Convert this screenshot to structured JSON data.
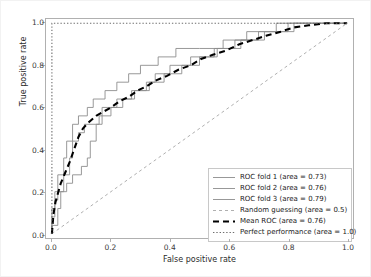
{
  "chart_data": {
    "type": "line",
    "title": "",
    "xlabel": "False positive rate",
    "ylabel": "True positive rate",
    "xlim": [
      -0.02,
      1.02
    ],
    "ylim": [
      -0.02,
      1.02
    ],
    "xticks": [
      "0.0",
      "0.2",
      "0.4",
      "0.6",
      "0.8",
      "1.0"
    ],
    "yticks": [
      "0.0",
      "0.2",
      "0.4",
      "0.6",
      "0.8",
      "1.0"
    ],
    "xtick_values": [
      0.0,
      0.2,
      0.4,
      0.6,
      0.8,
      1.0
    ],
    "ytick_values": [
      0.0,
      0.2,
      0.4,
      0.6,
      0.8,
      1.0
    ],
    "grid": false,
    "legend_position": "lower right",
    "series": [
      {
        "name": "ROC fold 1 (area = 0.73)",
        "area": 0.73,
        "style": "solid-thin",
        "color": "#8c8c8c",
        "points": [
          [
            0.0,
            0.0
          ],
          [
            0.0,
            0.04
          ],
          [
            0.02,
            0.04
          ],
          [
            0.02,
            0.12
          ],
          [
            0.03,
            0.12
          ],
          [
            0.03,
            0.2
          ],
          [
            0.05,
            0.2
          ],
          [
            0.05,
            0.24
          ],
          [
            0.07,
            0.24
          ],
          [
            0.07,
            0.28
          ],
          [
            0.1,
            0.28
          ],
          [
            0.1,
            0.32
          ],
          [
            0.12,
            0.32
          ],
          [
            0.12,
            0.36
          ],
          [
            0.13,
            0.36
          ],
          [
            0.13,
            0.44
          ],
          [
            0.15,
            0.44
          ],
          [
            0.15,
            0.52
          ],
          [
            0.17,
            0.52
          ],
          [
            0.17,
            0.6
          ],
          [
            0.22,
            0.6
          ],
          [
            0.22,
            0.64
          ],
          [
            0.27,
            0.64
          ],
          [
            0.27,
            0.68
          ],
          [
            0.32,
            0.68
          ],
          [
            0.32,
            0.72
          ],
          [
            0.35,
            0.72
          ],
          [
            0.35,
            0.76
          ],
          [
            0.4,
            0.76
          ],
          [
            0.4,
            0.8
          ],
          [
            0.47,
            0.8
          ],
          [
            0.47,
            0.84
          ],
          [
            0.52,
            0.84
          ],
          [
            0.52,
            0.84
          ],
          [
            0.55,
            0.84
          ],
          [
            0.55,
            0.88
          ],
          [
            0.62,
            0.88
          ],
          [
            0.62,
            0.92
          ],
          [
            0.7,
            0.92
          ],
          [
            0.7,
            0.96
          ],
          [
            0.8,
            0.96
          ],
          [
            0.8,
            1.0
          ],
          [
            1.0,
            1.0
          ]
        ]
      },
      {
        "name": "ROC fold 2 (area = 0.76)",
        "area": 0.76,
        "style": "solid-thin",
        "color": "#8c8c8c",
        "points": [
          [
            0.0,
            0.0
          ],
          [
            0.0,
            0.08
          ],
          [
            0.01,
            0.08
          ],
          [
            0.01,
            0.16
          ],
          [
            0.02,
            0.16
          ],
          [
            0.02,
            0.2
          ],
          [
            0.04,
            0.2
          ],
          [
            0.04,
            0.28
          ],
          [
            0.06,
            0.28
          ],
          [
            0.06,
            0.36
          ],
          [
            0.07,
            0.36
          ],
          [
            0.07,
            0.44
          ],
          [
            0.09,
            0.44
          ],
          [
            0.09,
            0.48
          ],
          [
            0.11,
            0.48
          ],
          [
            0.11,
            0.52
          ],
          [
            0.16,
            0.52
          ],
          [
            0.16,
            0.56
          ],
          [
            0.2,
            0.56
          ],
          [
            0.2,
            0.6
          ],
          [
            0.24,
            0.6
          ],
          [
            0.24,
            0.64
          ],
          [
            0.28,
            0.64
          ],
          [
            0.28,
            0.68
          ],
          [
            0.33,
            0.68
          ],
          [
            0.33,
            0.72
          ],
          [
            0.38,
            0.72
          ],
          [
            0.38,
            0.76
          ],
          [
            0.44,
            0.76
          ],
          [
            0.44,
            0.8
          ],
          [
            0.5,
            0.8
          ],
          [
            0.5,
            0.84
          ],
          [
            0.56,
            0.84
          ],
          [
            0.56,
            0.88
          ],
          [
            0.64,
            0.88
          ],
          [
            0.64,
            0.92
          ],
          [
            0.72,
            0.92
          ],
          [
            0.72,
            0.96
          ],
          [
            0.82,
            0.96
          ],
          [
            0.82,
            1.0
          ],
          [
            1.0,
            1.0
          ]
        ]
      },
      {
        "name": "ROC fold 3 (area = 0.79)",
        "area": 0.79,
        "style": "solid-thin",
        "color": "#8c8c8c",
        "points": [
          [
            0.0,
            0.0
          ],
          [
            0.0,
            0.12
          ],
          [
            0.01,
            0.12
          ],
          [
            0.01,
            0.2
          ],
          [
            0.02,
            0.2
          ],
          [
            0.02,
            0.28
          ],
          [
            0.04,
            0.28
          ],
          [
            0.04,
            0.36
          ],
          [
            0.05,
            0.36
          ],
          [
            0.05,
            0.44
          ],
          [
            0.07,
            0.44
          ],
          [
            0.07,
            0.52
          ],
          [
            0.09,
            0.52
          ],
          [
            0.09,
            0.56
          ],
          [
            0.12,
            0.56
          ],
          [
            0.12,
            0.6
          ],
          [
            0.14,
            0.6
          ],
          [
            0.14,
            0.64
          ],
          [
            0.18,
            0.64
          ],
          [
            0.18,
            0.68
          ],
          [
            0.22,
            0.68
          ],
          [
            0.22,
            0.72
          ],
          [
            0.26,
            0.72
          ],
          [
            0.26,
            0.76
          ],
          [
            0.3,
            0.76
          ],
          [
            0.3,
            0.8
          ],
          [
            0.36,
            0.8
          ],
          [
            0.36,
            0.84
          ],
          [
            0.42,
            0.84
          ],
          [
            0.42,
            0.88
          ],
          [
            0.5,
            0.88
          ],
          [
            0.5,
            0.88
          ],
          [
            0.58,
            0.88
          ],
          [
            0.58,
            0.92
          ],
          [
            0.66,
            0.92
          ],
          [
            0.66,
            0.96
          ],
          [
            0.76,
            0.96
          ],
          [
            0.76,
            1.0
          ],
          [
            1.0,
            1.0
          ]
        ]
      },
      {
        "name": "Random guessing (area = 0.5)",
        "area": 0.5,
        "style": "dashed-thin",
        "color": "#9a9a9a",
        "points": [
          [
            0.0,
            0.0
          ],
          [
            1.0,
            1.0
          ]
        ]
      },
      {
        "name": "Mean ROC (area = 0.76)",
        "area": 0.76,
        "style": "dashed-thick",
        "color": "#000000",
        "points": [
          [
            0.0,
            0.0
          ],
          [
            0.005,
            0.09
          ],
          [
            0.012,
            0.15
          ],
          [
            0.02,
            0.19
          ],
          [
            0.03,
            0.24
          ],
          [
            0.045,
            0.29
          ],
          [
            0.06,
            0.34
          ],
          [
            0.075,
            0.4
          ],
          [
            0.09,
            0.46
          ],
          [
            0.105,
            0.5
          ],
          [
            0.125,
            0.53
          ],
          [
            0.15,
            0.56
          ],
          [
            0.175,
            0.58
          ],
          [
            0.2,
            0.6
          ],
          [
            0.23,
            0.63
          ],
          [
            0.26,
            0.65
          ],
          [
            0.29,
            0.68
          ],
          [
            0.32,
            0.7
          ],
          [
            0.355,
            0.73
          ],
          [
            0.39,
            0.75
          ],
          [
            0.43,
            0.78
          ],
          [
            0.47,
            0.8
          ],
          [
            0.505,
            0.83
          ],
          [
            0.545,
            0.85
          ],
          [
            0.59,
            0.87
          ],
          [
            0.635,
            0.9
          ],
          [
            0.68,
            0.92
          ],
          [
            0.725,
            0.94
          ],
          [
            0.775,
            0.96
          ],
          [
            0.82,
            0.98
          ],
          [
            0.87,
            0.99
          ],
          [
            0.93,
            1.0
          ],
          [
            1.0,
            1.0
          ]
        ]
      },
      {
        "name": "Perfect performance (area = 1.0)",
        "area": 1.0,
        "style": "dotted",
        "color": "#6e6e6e",
        "points": [
          [
            0.0,
            0.0
          ],
          [
            0.0,
            1.0
          ],
          [
            1.0,
            1.0
          ]
        ]
      }
    ]
  }
}
